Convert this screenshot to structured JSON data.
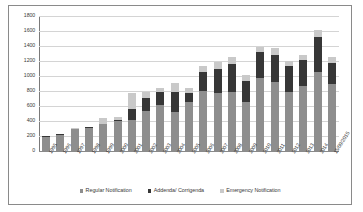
{
  "chart_data": {
    "type": "bar",
    "subtype": "stacked-vertical",
    "title": "",
    "xlabel": "",
    "ylabel": "",
    "ylim": [
      0,
      1800
    ],
    "ytick_step": 200,
    "yticks": [
      0,
      200,
      400,
      600,
      800,
      1000,
      1200,
      1400,
      1600,
      1800
    ],
    "grid": true,
    "legend_position": "bottom",
    "categories": [
      "1995",
      "1996",
      "1997",
      "1998",
      "1999",
      "2000",
      "2001",
      "2002",
      "2003",
      "2004",
      "2005",
      "2006",
      "2007",
      "2008",
      "2009",
      "2010",
      "2011",
      "2012",
      "2013",
      "2014",
      "15/09/2015"
    ],
    "series": [
      {
        "name": "Regular Notification",
        "color": "#8e8e8e",
        "values": [
          190,
          220,
          290,
          310,
          355,
          400,
          420,
          530,
          620,
          515,
          650,
          800,
          780,
          790,
          660,
          980,
          925,
          790,
          865,
          1055,
          890
        ]
      },
      {
        "name": "Addenda/ Corrigenda",
        "color": "#373737",
        "values": [
          5,
          10,
          10,
          10,
          10,
          15,
          135,
          175,
          165,
          275,
          130,
          255,
          320,
          370,
          280,
          345,
          360,
          345,
          350,
          465,
          285
        ]
      },
      {
        "name": "Emergency Notification",
        "color": "#c9c9c9",
        "values": [
          2,
          3,
          3,
          3,
          70,
          40,
          215,
          85,
          50,
          120,
          60,
          80,
          85,
          90,
          70,
          60,
          90,
          65,
          65,
          100,
          75
        ]
      }
    ],
    "totals": [
      197,
      233,
      303,
      323,
      435,
      455,
      770,
      790,
      835,
      910,
      840,
      1135,
      1185,
      1250,
      1010,
      1385,
      1375,
      1200,
      1280,
      1620,
      1250
    ]
  },
  "legend": {
    "items": [
      {
        "label": "Regular Notification"
      },
      {
        "label": "Addenda/ Corrigenda"
      },
      {
        "label": "Emergency Notification"
      }
    ]
  }
}
